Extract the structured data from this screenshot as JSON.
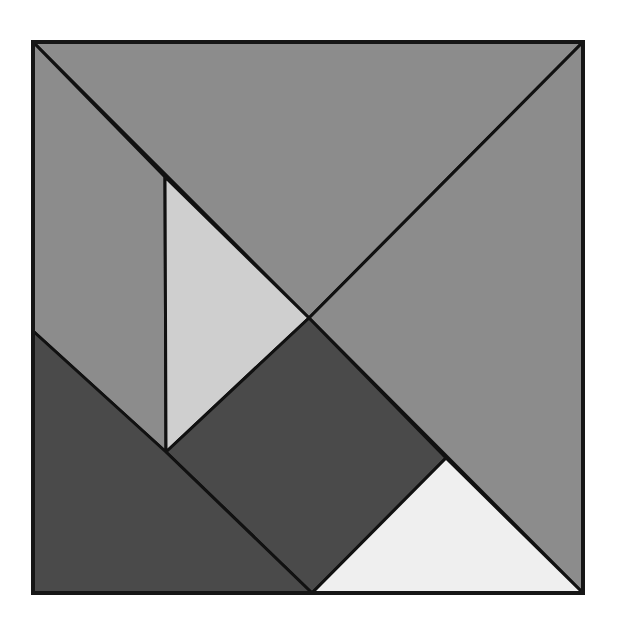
{
  "diagram": {
    "type": "tangram-square",
    "frame": {
      "x": 33,
      "y": 42,
      "width": 550,
      "height": 551
    },
    "stroke_color": "#111111",
    "pieces": [
      {
        "id": "large-triangle-top",
        "shape": "triangle",
        "fill": "#8c8c8c",
        "points": "33,42 583,42 309,318"
      },
      {
        "id": "large-triangle-right",
        "shape": "triangle",
        "fill": "#8c8c8c",
        "points": "583,42 583,593 309,318"
      },
      {
        "id": "parallelogram-left",
        "shape": "parallelogram",
        "fill": "#8c8c8c",
        "points": "33,42 165,177 166,452 33,331"
      },
      {
        "id": "small-triangle-middle",
        "shape": "triangle",
        "fill": "#cfcfcf",
        "points": "165,177 309,318 166,452"
      },
      {
        "id": "square-center",
        "shape": "square",
        "fill": "#4a4a4a",
        "points": "309,318 446,458 312,593 166,452"
      },
      {
        "id": "medium-triangle-bottom-left",
        "shape": "triangle",
        "fill": "#4a4a4a",
        "points": "33,331 166,452 312,593 33,593"
      },
      {
        "id": "small-triangle-bottom",
        "shape": "triangle",
        "fill": "#efefef",
        "points": "446,458 583,593 312,593"
      }
    ]
  }
}
